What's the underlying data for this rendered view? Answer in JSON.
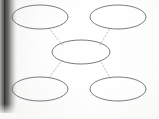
{
  "document": {
    "type": "concept-map-worksheet",
    "title": "",
    "instructions": "",
    "page_background_color": "#fdfdfc",
    "scan_artifact": {
      "name": "left-edge-scan-shadow",
      "position": "left",
      "color_dark": "#3c3c3b",
      "color_light": "#fafaf9"
    }
  },
  "diagram": {
    "kind": "word-web",
    "shape": "ellipse",
    "outline_color": "#6b6b72",
    "connector_color": "#b6b2ae",
    "connector_style": "dotted",
    "fill_color": "none",
    "node_count": 5,
    "connector_count": 4,
    "nodes": [
      {
        "id": "node-top-left",
        "label": "",
        "role": "branch",
        "cx": 40,
        "cy": 17,
        "rx": 28,
        "ry": 12
      },
      {
        "id": "node-top-right",
        "label": "",
        "role": "branch",
        "cx": 118,
        "cy": 17,
        "rx": 28,
        "ry": 12
      },
      {
        "id": "node-center",
        "label": "",
        "role": "main-topic",
        "cx": 81,
        "cy": 52,
        "rx": 29,
        "ry": 12
      },
      {
        "id": "node-bottom-left",
        "label": "",
        "role": "branch",
        "cx": 40,
        "cy": 89,
        "rx": 28,
        "ry": 12
      },
      {
        "id": "node-bottom-right",
        "label": "",
        "role": "branch",
        "cx": 118,
        "cy": 89,
        "rx": 28,
        "ry": 12
      }
    ],
    "connectors": [
      {
        "id": "connector-center-to-top-left",
        "from": "node-center",
        "to": "node-top-left",
        "x1": 62,
        "y1": 45,
        "x2": 49,
        "y2": 28
      },
      {
        "id": "connector-center-to-top-right",
        "from": "node-center",
        "to": "node-top-right",
        "x1": 100,
        "y1": 45,
        "x2": 110,
        "y2": 28
      },
      {
        "id": "connector-center-to-bottom-left",
        "from": "node-center",
        "to": "node-bottom-left",
        "x1": 62,
        "y1": 60,
        "x2": 49,
        "y2": 78
      },
      {
        "id": "connector-center-to-bottom-right",
        "from": "node-center",
        "to": "node-bottom-right",
        "x1": 100,
        "y1": 60,
        "x2": 110,
        "y2": 78
      }
    ]
  }
}
